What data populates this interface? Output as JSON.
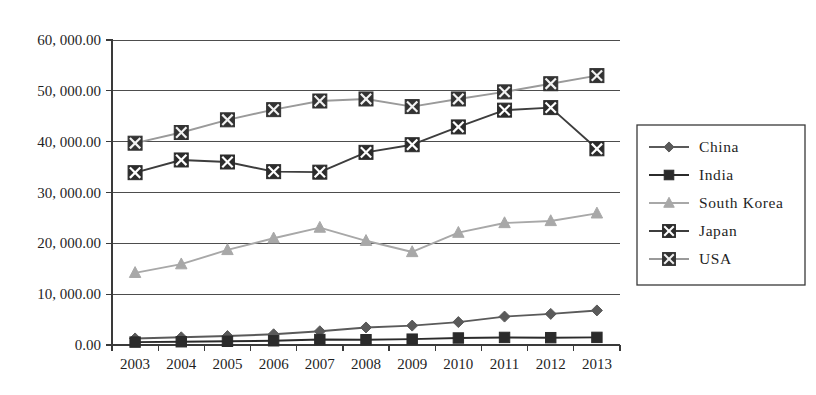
{
  "chart_data": {
    "type": "line",
    "title": "",
    "xlabel": "",
    "ylabel": "",
    "categories": [
      "2003",
      "2004",
      "2005",
      "2006",
      "2007",
      "2008",
      "2009",
      "2010",
      "2011",
      "2012",
      "2013"
    ],
    "ylim": [
      0,
      60000
    ],
    "ytick_values": [
      0,
      10000,
      20000,
      30000,
      40000,
      50000,
      60000
    ],
    "ytick_labels": [
      "0.00",
      "10, 000.00",
      "20, 000.00",
      "30, 000.00",
      "40, 000.00",
      "50, 000.00",
      "60, 000.00"
    ],
    "grid": true,
    "legend_position": "right",
    "series": [
      {
        "name": "China",
        "marker": "diamond",
        "color": "#5a5a5a",
        "values": [
          1290,
          1510,
          1760,
          2110,
          2700,
          3450,
          3820,
          4510,
          5590,
          6120,
          6800
        ]
      },
      {
        "name": "India",
        "marker": "square",
        "color": "#2b2b2b",
        "values": [
          570,
          640,
          730,
          830,
          1070,
          1040,
          1150,
          1380,
          1490,
          1440,
          1500
        ]
      },
      {
        "name": "South Korea",
        "marker": "triangle",
        "color": "#a8a8a8",
        "values": [
          14200,
          15900,
          18700,
          21000,
          23100,
          20500,
          18300,
          22100,
          24000,
          24400,
          25900
        ]
      },
      {
        "name": "Japan",
        "marker": "square-x",
        "color": "#3d3d3d",
        "values": [
          33900,
          36400,
          36000,
          34100,
          34000,
          37900,
          39400,
          42900,
          46200,
          46700,
          38600
        ]
      },
      {
        "name": "USA",
        "marker": "square-x-light",
        "color": "#9a9a9a",
        "values": [
          39700,
          41800,
          44300,
          46300,
          48000,
          48400,
          46900,
          48400,
          49800,
          51400,
          53000
        ]
      }
    ]
  },
  "legend": {
    "entries": [
      {
        "label": "China"
      },
      {
        "label": "India"
      },
      {
        "label": "South Korea"
      },
      {
        "label": "Japan"
      },
      {
        "label": "USA"
      }
    ]
  }
}
